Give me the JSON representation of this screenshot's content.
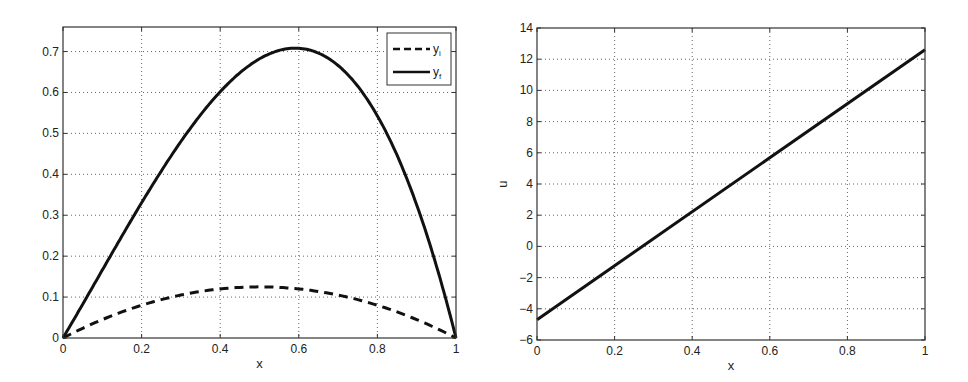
{
  "chart_data": [
    {
      "type": "line",
      "title": "",
      "xlabel": "x",
      "ylabel": "",
      "xlim": [
        0,
        1
      ],
      "ylim": [
        0,
        0.76
      ],
      "grid": true,
      "legend_position": "upper right",
      "xticks": [
        "0",
        "0.2",
        "0.4",
        "0.6",
        "0.8",
        "1"
      ],
      "yticks": [
        "0",
        "0.1",
        "0.2",
        "0.3",
        "0.4",
        "0.5",
        "0.6",
        "0.7"
      ],
      "series": [
        {
          "name": "y_i",
          "style": "dashed",
          "x": [
            0,
            0.1,
            0.2,
            0.3,
            0.4,
            0.5,
            0.6,
            0.7,
            0.8,
            0.9,
            1.0
          ],
          "values": [
            0,
            0.045,
            0.08,
            0.105,
            0.12,
            0.125,
            0.12,
            0.105,
            0.08,
            0.045,
            0
          ]
        },
        {
          "name": "y_f",
          "style": "solid",
          "x": [
            0,
            0.1,
            0.2,
            0.3,
            0.4,
            0.5,
            0.6,
            0.62,
            0.7,
            0.8,
            0.9,
            1.0
          ],
          "values": [
            0,
            0.11,
            0.25,
            0.39,
            0.51,
            0.61,
            0.66,
            0.665,
            0.64,
            0.52,
            0.32,
            0
          ]
        }
      ],
      "legend": [
        "y_i",
        "y_f"
      ]
    },
    {
      "type": "line",
      "title": "",
      "xlabel": "x",
      "ylabel": "u",
      "xlim": [
        0,
        1
      ],
      "ylim": [
        -6,
        14
      ],
      "grid": true,
      "xticks": [
        "0",
        "0.2",
        "0.4",
        "0.6",
        "0.8",
        "1"
      ],
      "yticks": [
        "-6",
        "-4",
        "-2",
        "0",
        "2",
        "4",
        "6",
        "8",
        "10",
        "12",
        "14"
      ],
      "series": [
        {
          "name": "u",
          "style": "solid",
          "x": [
            0,
            1
          ],
          "values": [
            -4.7,
            12.6
          ]
        }
      ]
    }
  ]
}
